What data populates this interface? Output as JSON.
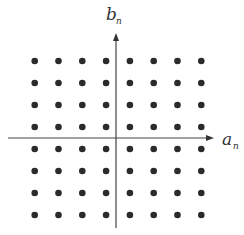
{
  "diagram": {
    "type": "constellation",
    "title": "",
    "x_axis_label": "a",
    "x_axis_subscript": "n",
    "y_axis_label": "b",
    "y_axis_subscript": "n",
    "a_levels": [
      -7,
      -5,
      -3,
      -1,
      1,
      3,
      5,
      7
    ],
    "b_levels": [
      -7,
      -5,
      -3,
      -1,
      1,
      3,
      5,
      7
    ],
    "point_count": 64,
    "colors": {
      "points": "#2b2b2b",
      "axes": "#444444",
      "labels": "#333333"
    }
  }
}
